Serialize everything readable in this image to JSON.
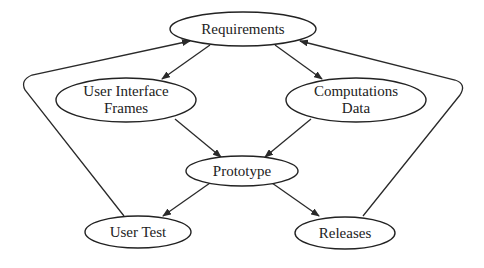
{
  "diagram": {
    "type": "flowchart",
    "colors": {
      "background": "#ffffff",
      "stroke": "#222222",
      "text": "#222222"
    },
    "nodes": {
      "requirements": {
        "label": "Requirements"
      },
      "ui_frames": {
        "line1": "User Interface",
        "line2": "Frames"
      },
      "computations": {
        "line1": "Computations",
        "line2": "Data"
      },
      "prototype": {
        "label": "Prototype"
      },
      "user_test": {
        "label": "User Test"
      },
      "releases": {
        "label": "Releases"
      }
    },
    "edges": [
      {
        "from": "Requirements",
        "to": "User Interface Frames"
      },
      {
        "from": "Requirements",
        "to": "Computations Data"
      },
      {
        "from": "User Interface Frames",
        "to": "Prototype"
      },
      {
        "from": "Computations Data",
        "to": "Prototype"
      },
      {
        "from": "Prototype",
        "to": "User Test"
      },
      {
        "from": "Prototype",
        "to": "Releases"
      },
      {
        "from": "User Test",
        "to": "Requirements"
      },
      {
        "from": "Releases",
        "to": "Requirements"
      }
    ]
  }
}
